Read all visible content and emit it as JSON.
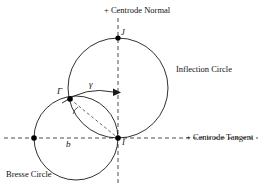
{
  "figure": {
    "title_elements": {
      "centrode_normal": "+  Centrode Normal",
      "centrode_tangent": "+  Centrode Tangent",
      "inflection_circle": "Inflection Circle",
      "bresse_circle": "Bresse Circle"
    },
    "point_labels": {
      "J": "J",
      "I": "I",
      "Gamma": "Γ",
      "gamma_angle": "γ",
      "b": "b"
    },
    "colors": {
      "stroke": "#1a1a1a",
      "dashed": "#4d4d4d",
      "background": "#ffffff",
      "point_fill": "#000000"
    },
    "geometry": {
      "origin_I": [
        118,
        138
      ],
      "point_J": [
        118,
        38
      ],
      "point_Gamma": [
        70,
        99
      ],
      "point_left_dot": [
        34,
        138
      ],
      "inflection_circle": {
        "cx": 118,
        "cy": 88,
        "r": 50
      },
      "bresse_circle": {
        "cx": 76,
        "cy": 138,
        "r": 42
      },
      "vertical_axis_x": 118,
      "horizontal_axis_y": 138
    }
  }
}
